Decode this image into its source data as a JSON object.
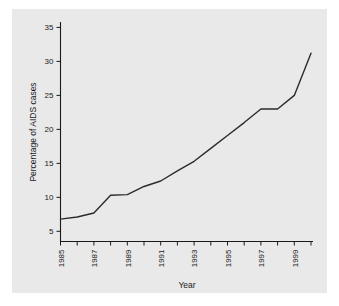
{
  "figure": {
    "background_color": "#ffffff",
    "panel_color": "#e9e9e9",
    "line_color": "#2b2b2b",
    "text_color": "#1a1a1a"
  },
  "chart_data": {
    "type": "line",
    "title": "",
    "xlabel": "Year",
    "ylabel": "Percentage of AIDS cases",
    "xlim": [
      1985,
      2000
    ],
    "ylim": [
      3.5,
      35.8
    ],
    "grid": false,
    "legend": "none",
    "x_tick_labels": [
      "1985",
      "1987",
      "1989",
      "1991",
      "1993",
      "1995",
      "1997",
      "1999"
    ],
    "x_tick_label_values": [
      1985,
      1987,
      1989,
      1991,
      1993,
      1995,
      1997,
      1999
    ],
    "x_minor_ticks": [
      1985,
      1986,
      1987,
      1988,
      1989,
      1990,
      1991,
      1992,
      1993,
      1994,
      1995,
      1996,
      1997,
      1998,
      1999,
      2000
    ],
    "x_tick_rotation": 90,
    "y_tick_labels": [
      "5",
      "10",
      "15",
      "20",
      "25",
      "30",
      "35"
    ],
    "y_tick_values": [
      5,
      10,
      15,
      20,
      25,
      30,
      35
    ],
    "x": [
      1985,
      1986,
      1987,
      1988,
      1989,
      1990,
      1991,
      1992,
      1993,
      1994,
      1995,
      1996,
      1997,
      1998,
      1999,
      2000
    ],
    "values": [
      6.8,
      7.1,
      7.7,
      10.3,
      10.4,
      11.6,
      12.4,
      13.9,
      15.3,
      17.2,
      19.1,
      21.0,
      23.0,
      23.0,
      25.0,
      31.2
    ],
    "series": [
      {
        "name": "Percentage of AIDS cases",
        "values": [
          6.8,
          7.1,
          7.7,
          10.3,
          10.4,
          11.6,
          12.4,
          13.9,
          15.3,
          17.2,
          19.1,
          21.0,
          23.0,
          23.0,
          25.0,
          31.2
        ]
      }
    ]
  }
}
